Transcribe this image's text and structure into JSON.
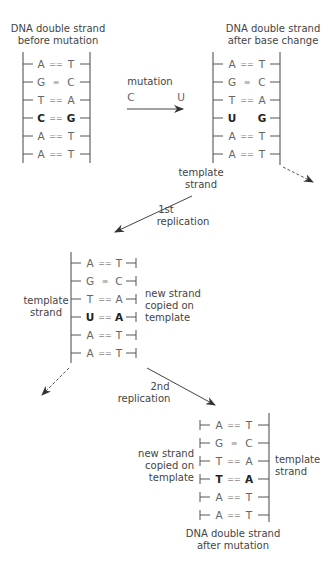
{
  "panel_before": {
    "title_line1": "DNA double strand",
    "title_line2": "before mutation",
    "pairs": [
      {
        "left": "A",
        "bond": "==",
        "right": "T",
        "bold": false
      },
      {
        "left": "G",
        "bond": "≡",
        "right": "C",
        "bold": false
      },
      {
        "left": "T",
        "bond": "==",
        "right": "A",
        "bold": false
      },
      {
        "left": "C",
        "bond": "==",
        "right": "G",
        "bold": true
      },
      {
        "left": "A",
        "bond": "==",
        "right": "T",
        "bold": false
      },
      {
        "left": "A",
        "bond": "==",
        "right": "T",
        "bold": false
      }
    ]
  },
  "mutation_arrow": {
    "label": "mutation",
    "from": "C",
    "to": "U"
  },
  "panel_after_change": {
    "title_line1": "DNA double strand",
    "title_line2": "after base change",
    "pairs": [
      {
        "left": "A",
        "bond": "==",
        "right": "T",
        "bold": false
      },
      {
        "left": "G",
        "bond": "≡",
        "right": "C",
        "bold": false
      },
      {
        "left": "T",
        "bond": "==",
        "right": "A",
        "bold": false
      },
      {
        "left": "U",
        "bond": "",
        "right": "G",
        "bold": true
      },
      {
        "left": "A",
        "bond": "==",
        "right": "T",
        "bold": false
      },
      {
        "left": "A",
        "bond": "==",
        "right": "T",
        "bold": false
      }
    ],
    "template_label_line1": "template",
    "template_label_line2": "strand"
  },
  "replication1": {
    "label_line1": "1st",
    "label_line2": "replication"
  },
  "panel_first_replication": {
    "template_label_line1": "template",
    "template_label_line2": "strand",
    "new_strand_line1": "new strand",
    "new_strand_line2": "copied on",
    "new_strand_line3": "template",
    "pairs": [
      {
        "left": "A",
        "bond": "==",
        "right": "T",
        "bold": false
      },
      {
        "left": "G",
        "bond": "≡",
        "right": "C",
        "bold": false
      },
      {
        "left": "T",
        "bond": "==",
        "right": "A",
        "bold": false
      },
      {
        "left": "U",
        "bond": "==",
        "right": "A",
        "bold": true
      },
      {
        "left": "A",
        "bond": "==",
        "right": "T",
        "bold": false
      },
      {
        "left": "A",
        "bond": "==",
        "right": "T",
        "bold": false
      }
    ]
  },
  "replication2": {
    "label_line1": "2nd",
    "label_line2": "replication"
  },
  "panel_after_mutation": {
    "title_line1": "DNA double strand",
    "title_line2": "after mutation",
    "new_strand_line1": "new strand",
    "new_strand_line2": "copied on",
    "new_strand_line3": "template",
    "template_label_line1": "template",
    "template_label_line2": "strand",
    "pairs": [
      {
        "left": "A",
        "bond": "==",
        "right": "T",
        "bold": false
      },
      {
        "left": "G",
        "bond": "≡",
        "right": "C",
        "bold": false
      },
      {
        "left": "T",
        "bond": "==",
        "right": "A",
        "bold": false
      },
      {
        "left": "T",
        "bond": "==",
        "right": "A",
        "bold": true
      },
      {
        "left": "A",
        "bond": "==",
        "right": "T",
        "bold": false
      },
      {
        "left": "A",
        "bond": "==",
        "right": "T",
        "bold": false
      }
    ]
  }
}
